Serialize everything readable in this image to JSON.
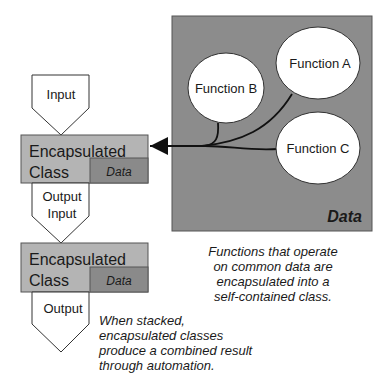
{
  "diagram": {
    "data_panel": {
      "label": "Data",
      "fill": "#8c8c8c",
      "functions": [
        {
          "name": "Function A"
        },
        {
          "name": "Function B"
        },
        {
          "name": "Function C"
        }
      ]
    },
    "stack": [
      {
        "type": "input",
        "label": "Input"
      },
      {
        "type": "class",
        "label_line1": "Encapsulated",
        "label_line2": "Class",
        "data_label": "Data"
      },
      {
        "type": "io",
        "label_line1": "Output",
        "label_line2": "Input"
      },
      {
        "type": "class",
        "label_line1": "Encapsulated",
        "label_line2": "Class",
        "data_label": "Data"
      },
      {
        "type": "output",
        "label": "Output"
      }
    ],
    "colors": {
      "class_fill": "#b4b4b4",
      "data_fill": "#8a8a8a",
      "panel_fill": "#8c8c8c",
      "stroke": "#333333"
    },
    "captions": {
      "right": [
        "Functions that operate",
        "on common data are",
        "encapsulated into a",
        "self-contained class."
      ],
      "left": [
        "When stacked,",
        "encapsulated classes",
        "produce a combined result",
        "through automation."
      ]
    }
  }
}
